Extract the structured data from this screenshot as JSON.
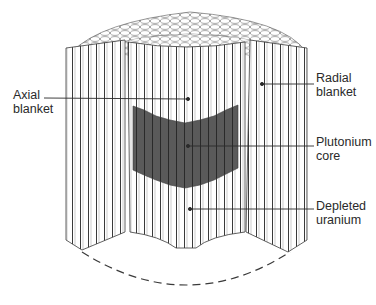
{
  "figure": {
    "colors": {
      "background": "#ffffff",
      "rod_fill": "#ffffff",
      "rod_stroke": "#3a3a3a",
      "core_fill": "#5a5a5a",
      "leader_line": "#2a2a2a",
      "dashed_base": "#3a3a3a"
    }
  },
  "labels": {
    "axial_blanket": {
      "line1": "Axial",
      "line2": "blanket"
    },
    "radial_blanket": {
      "line1": "Radial",
      "line2": "blanket"
    },
    "plutonium_core": {
      "line1": "Plutonium",
      "line2": "core"
    },
    "depleted_uranium": {
      "line1": "Depleted",
      "line2": "uranium"
    }
  }
}
